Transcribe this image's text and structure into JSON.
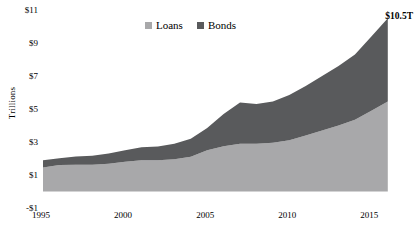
{
  "chart_data": {
    "type": "area",
    "stacked": true,
    "title": "",
    "subtitle": "",
    "xlabel": "",
    "ylabel": "Trillions",
    "xlim": [
      1995,
      2016.5
    ],
    "ylim": [
      -1,
      11
    ],
    "grid": false,
    "legend_position": "top-center",
    "y_ticks": [
      "$11",
      "$9",
      "$7",
      "$5",
      "$3",
      "$1",
      "-$1"
    ],
    "y_tick_values": [
      11,
      9,
      7,
      5,
      3,
      1,
      -1
    ],
    "x_ticks": [
      "1995",
      "2000",
      "2005",
      "2010",
      "2015"
    ],
    "x_tick_values": [
      1995,
      2000,
      2005,
      2010,
      2015
    ],
    "x": [
      1995,
      1996,
      1997,
      1998,
      1999,
      2000,
      2001,
      2002,
      2003,
      2004,
      2005,
      2006,
      2007,
      2008,
      2009,
      2010,
      2011,
      2012,
      2013,
      2014,
      2015,
      2016
    ],
    "series": [
      {
        "name": "Loans",
        "color": "#a8a8aa",
        "values": [
          1.45,
          1.6,
          1.62,
          1.62,
          1.68,
          1.8,
          1.9,
          1.9,
          1.95,
          2.1,
          2.5,
          2.75,
          2.9,
          2.9,
          2.95,
          3.1,
          3.4,
          3.7,
          4.0,
          4.35,
          4.9,
          5.45
        ]
      },
      {
        "name": "Bonds",
        "color": "#595a5c",
        "values": [
          0.45,
          0.42,
          0.5,
          0.55,
          0.62,
          0.7,
          0.78,
          0.82,
          0.95,
          1.1,
          1.35,
          1.95,
          2.5,
          2.4,
          2.5,
          2.75,
          3.0,
          3.3,
          3.6,
          3.95,
          4.5,
          5.05
        ]
      }
    ],
    "totals": [
      1.9,
      2.02,
      2.12,
      2.17,
      2.3,
      2.5,
      2.68,
      2.72,
      2.9,
      3.2,
      3.85,
      4.7,
      5.4,
      5.3,
      5.45,
      5.85,
      6.4,
      7.0,
      7.6,
      8.3,
      9.4,
      10.5
    ],
    "annotations": [
      {
        "name": "end-total",
        "text": "$10.5T",
        "x": 2016,
        "y": 10.5
      }
    ]
  },
  "legend": {
    "items": [
      {
        "label": "Loans",
        "color": "#a8a8aa"
      },
      {
        "label": "Bonds",
        "color": "#595a5c"
      }
    ]
  }
}
